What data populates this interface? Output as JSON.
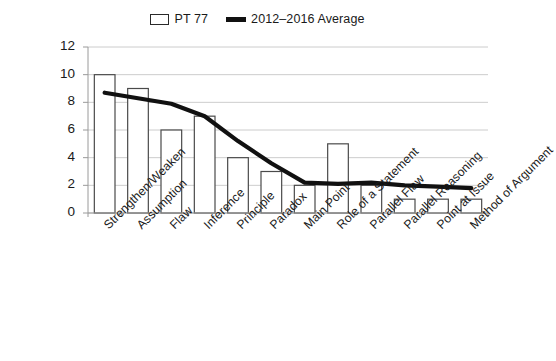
{
  "legend": {
    "position": "top-center",
    "entries": [
      {
        "label": "PT 77",
        "marker": "bar-swatch-icon",
        "fill": "#ffffff",
        "stroke": "#2a2a2a"
      },
      {
        "label": "2012–2016 Average",
        "marker": "line-swatch-icon",
        "color": "#111111"
      }
    ]
  },
  "chart_data": {
    "type": "bar",
    "title": "",
    "subtitle": "",
    "xlabel": "",
    "ylabel": "",
    "ylim": [
      0,
      12
    ],
    "ytick_step": 2,
    "yticks": [
      "0",
      "2",
      "4",
      "6",
      "8",
      "10",
      "12"
    ],
    "grid": true,
    "legend_position": "top-center",
    "categories": [
      "Strengthen/Weaken",
      "Assumption",
      "Flaw",
      "Inference",
      "Principle",
      "Paradox",
      "Main Point",
      "Role of a Statement",
      "Parallel Flaw",
      "Parallel Reasoning",
      "Point at Issue",
      "Method of Argument"
    ],
    "series": [
      {
        "name": "PT 77",
        "type": "bar",
        "values": [
          10,
          9,
          6,
          7,
          4,
          3,
          2,
          5,
          2,
          1,
          1,
          1
        ]
      },
      {
        "name": "2012–2016 Average",
        "type": "line",
        "values": [
          8.7,
          8.3,
          7.9,
          7.0,
          5.2,
          3.6,
          2.2,
          2.1,
          2.2,
          2.0,
          1.9,
          1.8
        ]
      }
    ]
  },
  "colors": {
    "bar_fill": "#ffffff",
    "bar_stroke": "#4a4a4a",
    "line": "#111111",
    "gridline": "#bfbfbf",
    "axis": "#9a9a9a",
    "text": "#1a1a1a",
    "background": "#ffffff"
  }
}
